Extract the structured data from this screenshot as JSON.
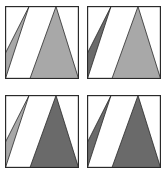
{
  "colors": {
    "border": "#2a2a2a",
    "light_fill": "#a8a8a8",
    "dark_fill": "#6a6a6a",
    "background": "#ffffff"
  },
  "panels": [
    {
      "id": "top-left",
      "sliver_fill": "light",
      "triangle_fill": "light"
    },
    {
      "id": "top-right",
      "sliver_fill": "dark",
      "triangle_fill": "light"
    },
    {
      "id": "bottom-left",
      "sliver_fill": "light",
      "triangle_fill": "dark"
    },
    {
      "id": "bottom-right",
      "sliver_fill": "dark",
      "triangle_fill": "dark"
    }
  ]
}
